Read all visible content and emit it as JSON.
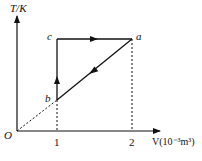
{
  "diagram": {
    "type": "thermodynamic-cycle",
    "axes": {
      "y_label": "T/K",
      "x_label": "V(10⁻³m³)",
      "origin_label": "O",
      "x_ticks": [
        "1",
        "2"
      ]
    },
    "points": {
      "a": {
        "label": "a",
        "V": 2
      },
      "b": {
        "label": "b",
        "V": 1
      },
      "c": {
        "label": "c",
        "V": 1
      }
    },
    "processes": [
      {
        "from": "b",
        "to": "c",
        "kind": "isochoric",
        "direction": "up"
      },
      {
        "from": "c",
        "to": "a",
        "kind": "isothermal",
        "direction": "right"
      },
      {
        "from": "a",
        "to": "b",
        "kind": "isobaric (line through origin)",
        "direction": "down-left"
      }
    ],
    "colors": {
      "line": "#111111",
      "background": "#ffffff"
    }
  }
}
